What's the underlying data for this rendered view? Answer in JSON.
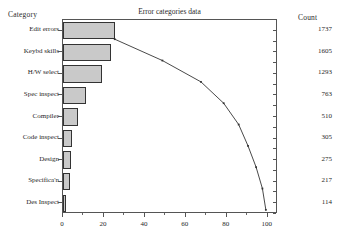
{
  "headers": {
    "category": "Category",
    "count": "Count"
  },
  "title": "Error categories data",
  "chart_data": {
    "type": "bar",
    "title": "Error categories data",
    "xlabel": "",
    "ylabel": "Category",
    "orientation": "horizontal",
    "xlim": [
      0,
      105
    ],
    "xticks": [
      0,
      20,
      40,
      60,
      80,
      100
    ],
    "xtick_labels": [
      "0",
      "20",
      "40",
      "60",
      "80",
      "100"
    ],
    "grid": false,
    "legend": false,
    "categories": [
      "Edit errors",
      "Keybd skills",
      "H/W select",
      "Spec inspect",
      "Compiler",
      "Code inspect",
      "Design",
      "Specifica'n",
      "Des Inspect"
    ],
    "counts": [
      1737,
      1605,
      1293,
      763,
      510,
      305,
      275,
      217,
      114
    ],
    "total_count": 6819,
    "percent": [
      25.5,
      23.5,
      19.0,
      11.2,
      7.5,
      4.5,
      4.0,
      3.2,
      1.7
    ],
    "series": [
      {
        "name": "Percent of total",
        "type": "bar",
        "values": [
          25.5,
          23.5,
          19.0,
          11.2,
          7.5,
          4.5,
          4.0,
          3.2,
          1.7
        ]
      },
      {
        "name": "Cumulative percent",
        "type": "line",
        "values": [
          25.5,
          49.0,
          68.0,
          79.2,
          86.6,
          91.2,
          95.2,
          98.3,
          100.0
        ]
      }
    ],
    "bar_fill_color": "#c9c9c9",
    "bar_edge_color": "#333333",
    "line_color": "#333333"
  },
  "xtick_labels": [
    "0",
    "20",
    "40",
    "60",
    "80",
    "100"
  ]
}
